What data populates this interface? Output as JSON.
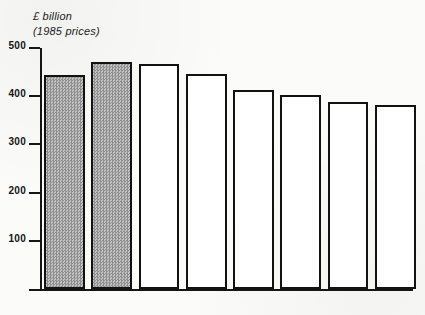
{
  "chart_data": {
    "type": "bar",
    "title": "£ billion",
    "subtitle": "(1985 prices)",
    "xlabel": "",
    "ylabel": "£ billion (1985 prices)",
    "categories": [
      "1975",
      "1979",
      "1980",
      "1981",
      "1982",
      "1983",
      "1984",
      "1985"
    ],
    "values": [
      445,
      471,
      466,
      447,
      412,
      402,
      387,
      382
    ],
    "yticks": [
      100,
      200,
      300,
      400,
      500
    ],
    "ytick_labels": [
      "100",
      "200",
      "300",
      "400",
      "500"
    ],
    "ylim": [
      0,
      500
    ],
    "grid": false,
    "legend": "none",
    "bar_styles": [
      "shaded",
      "shaded",
      "outline",
      "outline",
      "outline",
      "outline",
      "outline",
      "outline"
    ],
    "colors": {
      "shaded_fill": "#a9a9a9",
      "outline_fill": "#ffffff",
      "bar_stroke": "#121212",
      "axis": "#151515",
      "text": "#141414",
      "background": "#fbfbfa"
    }
  }
}
